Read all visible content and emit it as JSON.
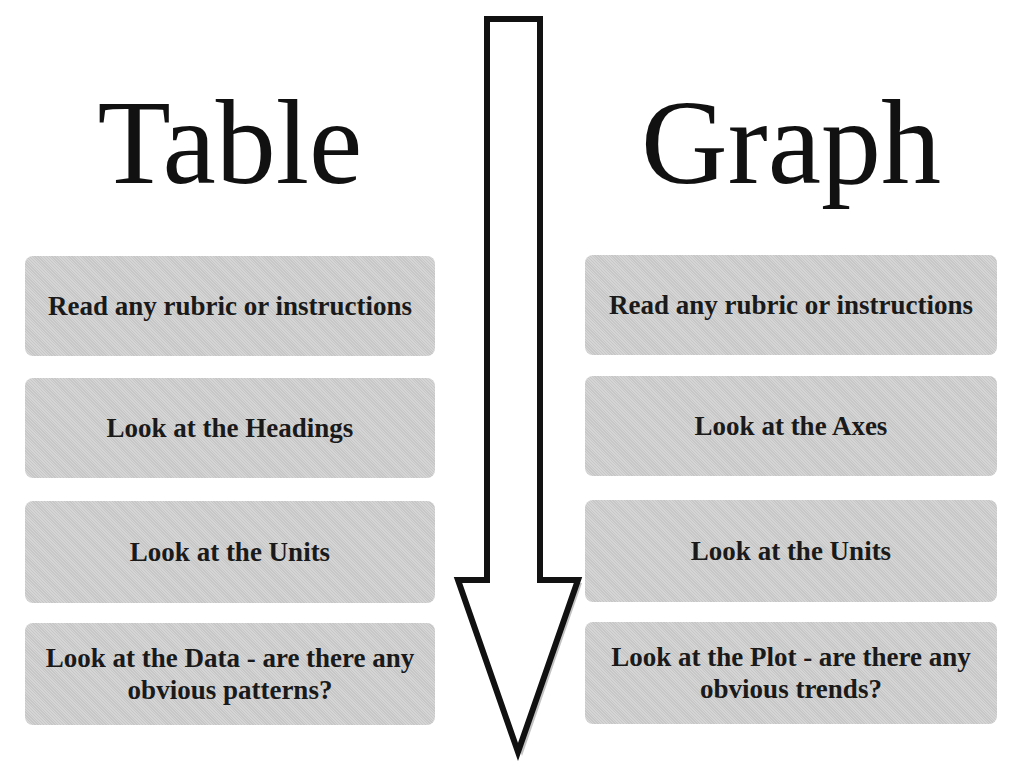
{
  "left": {
    "title": "Table",
    "steps": [
      "Read any rubric or instructions",
      "Look at the Headings",
      "Look at the Units",
      "Look at the Data - are there any obvious patterns?"
    ]
  },
  "right": {
    "title": "Graph",
    "steps": [
      "Read any rubric or instructions",
      "Look at the Axes",
      "Look at the Units",
      "Look at the Plot - are there any obvious trends?"
    ]
  },
  "arrow": {
    "icon": "down-arrow-icon",
    "direction": "down"
  },
  "colors": {
    "box_fill": "#cfcfcf",
    "text": "#1a1a1a",
    "arrow_stroke": "#111111"
  }
}
